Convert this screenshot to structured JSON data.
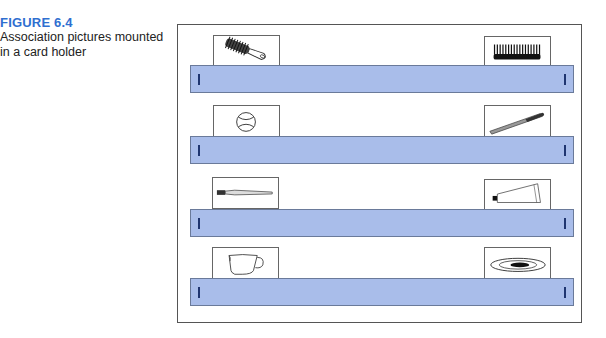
{
  "caption": {
    "label": "FIGURE 6.4",
    "text": "Association pictures mounted in a card holder"
  },
  "colors": {
    "label_blue": "#2f6fd0",
    "strip_fill": "#a9bdea",
    "strip_border": "#6a7a9a",
    "tick": "#1f3570",
    "frame": "#555555"
  },
  "rows": [
    {
      "left_picture": "hairbrush-icon",
      "right_picture": "comb-icon"
    },
    {
      "left_picture": "baseball-icon",
      "right_picture": "baseball-bat-icon"
    },
    {
      "left_picture": "toothbrush-icon",
      "right_picture": "toothpaste-tube-icon"
    },
    {
      "left_picture": "teacup-icon",
      "right_picture": "saucer-icon"
    }
  ]
}
